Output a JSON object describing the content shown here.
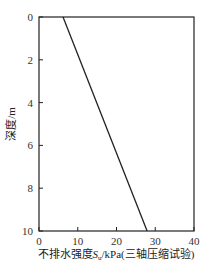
{
  "chart_data": {
    "type": "line",
    "title": "",
    "xlabel": "不排水强度S_u/kPa(三轴压缩试验)",
    "ylabel": "深度/m",
    "xlim": [
      0,
      40
    ],
    "ylim": [
      10,
      0
    ],
    "y_inverted": true,
    "x_axis_position": "top",
    "x_ticks": [
      0,
      10,
      20,
      30,
      40
    ],
    "y_ticks": [
      0,
      2,
      4,
      6,
      8,
      10
    ],
    "grid": false,
    "legend": null,
    "series": [
      {
        "name": "Su",
        "x": [
          6.2,
          27.9
        ],
        "y": [
          0,
          10
        ]
      }
    ]
  },
  "labels": {
    "xlabel_pre": "不排水强度",
    "xlabel_sym": "S",
    "xlabel_sub": "u",
    "xlabel_post": "/kPa(三轴压缩试验)",
    "ylabel": "深度/m"
  }
}
